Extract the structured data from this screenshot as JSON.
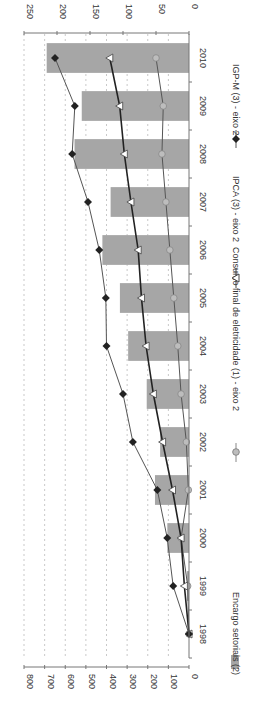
{
  "chart_data": {
    "type": "bar",
    "orientation": "rotated-90-clockwise",
    "title": "",
    "categories": [
      "1998",
      "1999",
      "2000",
      "2001",
      "2002",
      "2003",
      "2004",
      "2005",
      "2006",
      "2007",
      "2008",
      "2009",
      "2010"
    ],
    "primary_axis": {
      "ticks": [
        "0",
        "100",
        "200",
        "300",
        "400",
        "500",
        "600",
        "700",
        "800"
      ],
      "range": [
        0,
        800
      ]
    },
    "secondary_axis": {
      "ticks": [
        "0",
        "50",
        "100",
        "150",
        "200",
        "250"
      ],
      "range": [
        0,
        250
      ]
    },
    "grid": true,
    "legend_position": "bottom",
    "series": [
      {
        "name": "Encargo setoriais (2)",
        "type": "bar",
        "axis": "primary",
        "color": "#a6a6a6",
        "values": [
          0,
          10,
          105,
          165,
          140,
          205,
          295,
          335,
          420,
          380,
          555,
          520,
          690
        ]
      },
      {
        "name": "Consumo final de eletricidade (1) - eixo 2",
        "type": "line",
        "axis": "secondary",
        "marker": "circle",
        "color": "#808080",
        "values": [
          0,
          2,
          12,
          1,
          4,
          12,
          17,
          23,
          29,
          35,
          41,
          39,
          50
        ]
      },
      {
        "name": "IPCA (3) - eixo 2",
        "type": "line",
        "axis": "secondary",
        "marker": "triangle",
        "color": "#333333",
        "values": [
          0,
          7,
          12,
          25,
          40,
          54,
          65,
          72,
          77,
          88,
          98,
          105,
          120
        ]
      },
      {
        "name": "IGP-M (3) - eixo 2",
        "type": "line",
        "axis": "secondary",
        "marker": "diamond",
        "color": "#555555",
        "values": [
          0,
          24,
          33,
          48,
          85,
          100,
          125,
          126,
          136,
          153,
          177,
          173,
          203
        ]
      }
    ]
  },
  "legend": {
    "items": [
      {
        "label": "Encargo setoriais (2)"
      },
      {
        "label": "Consumo final de eletricidade (1) - eixo 2"
      },
      {
        "label": "IPCA (3) - eixo 2"
      },
      {
        "label": "IGP-M (3) - eixo 2"
      }
    ]
  }
}
